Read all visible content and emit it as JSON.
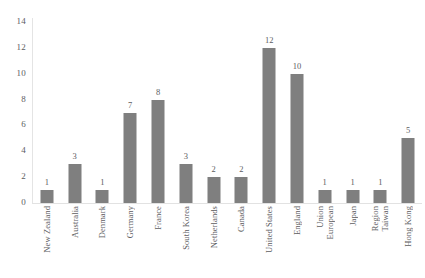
{
  "chart_data": {
    "type": "bar",
    "title": "",
    "subtitle": "",
    "xlabel": "",
    "ylabel": "",
    "ylim": [
      0,
      14
    ],
    "yticks": [
      0,
      2,
      4,
      6,
      8,
      10,
      12,
      14
    ],
    "grid": false,
    "legend": "none",
    "bar_color": "#7f7f7f",
    "data_labels": true,
    "categories": [
      "New Zealand",
      "Australia",
      "Denmark",
      "Germany",
      "France",
      "South Korea",
      "Netherlands",
      "Canada",
      "United States",
      "England",
      "European Union",
      "Japan",
      "Taiwan Region",
      "Hong Kong"
    ],
    "category_lines": [
      [
        "New Zealand"
      ],
      [
        "Australia"
      ],
      [
        "Denmark"
      ],
      [
        "Germany"
      ],
      [
        "France"
      ],
      [
        "South Korea"
      ],
      [
        "Netherlands"
      ],
      [
        "Canada"
      ],
      [
        "United States"
      ],
      [
        "England"
      ],
      [
        "European",
        "Union"
      ],
      [
        "Japan"
      ],
      [
        "Taiwan",
        "Region"
      ],
      [
        "Hong Kong"
      ]
    ],
    "values": [
      1,
      3,
      1,
      7,
      8,
      3,
      2,
      2,
      12,
      10,
      1,
      1,
      1,
      5
    ],
    "value_labels": [
      "1",
      "3",
      "1",
      "7",
      "8",
      "3",
      "2",
      "2",
      "12",
      "10",
      "1",
      "1",
      "1",
      "5"
    ],
    "ytick_labels": [
      "0",
      "2",
      "4",
      "6",
      "8",
      "10",
      "12",
      "14"
    ]
  }
}
